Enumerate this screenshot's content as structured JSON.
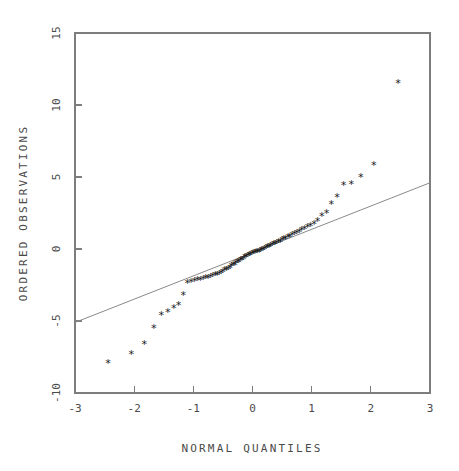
{
  "chart_data": {
    "type": "scatter",
    "title": "",
    "subtitle": "",
    "xlabel": "NORMAL QUANTILES",
    "ylabel": "ORDERED OBSERVATIONS",
    "xlim": [
      -3,
      3
    ],
    "ylim": [
      -10,
      15
    ],
    "xticks": [
      -3,
      -2,
      -1,
      0,
      1,
      2,
      3
    ],
    "xticklabels": [
      "-3",
      "-2",
      "-1",
      "0",
      "1",
      "2",
      "3"
    ],
    "yticks": [
      -10,
      -5,
      0,
      5,
      10,
      15
    ],
    "yticklabels": [
      "-10",
      "-5",
      "0",
      "5",
      "10",
      "15"
    ],
    "grid": false,
    "legend": null,
    "marker": "asterisk",
    "marker_color": "#1a1a1a",
    "frame": "box",
    "series": [
      {
        "name": "ordered observations",
        "x": [
          -2.44,
          -2.05,
          -1.83,
          -1.67,
          -1.54,
          -1.43,
          -1.33,
          -1.25,
          -1.17,
          -1.1,
          -1.04,
          -0.98,
          -0.93,
          -0.88,
          -0.83,
          -0.79,
          -0.75,
          -0.71,
          -0.67,
          -0.63,
          -0.6,
          -0.56,
          -0.53,
          -0.5,
          -0.47,
          -0.44,
          -0.41,
          -0.38,
          -0.36,
          -0.33,
          -0.3,
          -0.28,
          -0.25,
          -0.23,
          -0.2,
          -0.18,
          -0.15,
          -0.13,
          -0.11,
          -0.08,
          -0.06,
          -0.04,
          -0.01,
          0.01,
          0.04,
          0.06,
          0.08,
          0.11,
          0.13,
          0.15,
          0.18,
          0.2,
          0.23,
          0.25,
          0.28,
          0.3,
          0.33,
          0.36,
          0.38,
          0.41,
          0.44,
          0.47,
          0.5,
          0.53,
          0.56,
          0.6,
          0.63,
          0.67,
          0.71,
          0.75,
          0.79,
          0.83,
          0.88,
          0.93,
          0.98,
          1.04,
          1.1,
          1.17,
          1.25,
          1.33,
          1.43,
          1.54,
          1.67,
          1.83,
          2.05,
          2.46
        ],
        "y": [
          -7.9,
          -7.3,
          -6.6,
          -5.5,
          -4.6,
          -4.4,
          -4.1,
          -3.9,
          -3.2,
          -2.4,
          -2.3,
          -2.25,
          -2.2,
          -2.15,
          -2.1,
          -2.05,
          -2.0,
          -1.95,
          -1.9,
          -1.85,
          -1.8,
          -1.75,
          -1.7,
          -1.6,
          -1.5,
          -1.45,
          -1.4,
          -1.3,
          -1.2,
          -1.15,
          -1.1,
          -1.0,
          -0.95,
          -0.9,
          -0.8,
          -0.75,
          -0.7,
          -0.6,
          -0.55,
          -0.5,
          -0.45,
          -0.4,
          -0.35,
          -0.3,
          -0.3,
          -0.25,
          -0.2,
          -0.2,
          -0.15,
          -0.1,
          -0.05,
          0.0,
          0.05,
          0.1,
          0.15,
          0.2,
          0.25,
          0.3,
          0.35,
          0.4,
          0.45,
          0.5,
          0.6,
          0.65,
          0.7,
          0.8,
          0.85,
          0.95,
          1.0,
          1.1,
          1.2,
          1.3,
          1.4,
          1.5,
          1.6,
          1.7,
          1.9,
          2.3,
          2.5,
          3.1,
          3.6,
          4.4,
          4.5,
          5.0,
          5.8,
          11.5
        ]
      }
    ],
    "reference_line": {
      "name": "normal reference line",
      "x": [
        -3,
        3
      ],
      "y": [
        -5.1,
        4.6
      ],
      "slope": 1.617,
      "intercept": -0.25
    }
  }
}
